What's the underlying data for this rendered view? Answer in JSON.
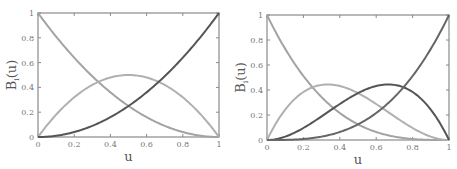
{
  "chart_data": [
    {
      "type": "line",
      "title": "",
      "xlabel": "u",
      "ylabel": "B_i(u)",
      "ylabel_main": "B",
      "ylabel_sub": "i",
      "ylabel_tail": "(u)",
      "xlim": [
        0,
        1
      ],
      "ylim": [
        0,
        1
      ],
      "xticks": [
        "0",
        "0.2",
        "0.4",
        "0.6",
        "0.8",
        "1"
      ],
      "yticks": [
        "0",
        "0.2",
        "0.4",
        "0.6",
        "0.8",
        "1"
      ],
      "grid": false,
      "degree": 2,
      "x": [
        0,
        0.1,
        0.2,
        0.3,
        0.4,
        0.5,
        0.6,
        0.7,
        0.8,
        0.9,
        1.0
      ],
      "series": [
        {
          "name": "B0 (1-u)^2",
          "color": "#a3a3a3",
          "values": [
            1.0,
            0.81,
            0.64,
            0.49,
            0.36,
            0.25,
            0.16,
            0.09,
            0.04,
            0.01,
            0.0
          ]
        },
        {
          "name": "B1 2u(1-u)",
          "color": "#b0b0b0",
          "values": [
            0.0,
            0.18,
            0.32,
            0.42,
            0.48,
            0.5,
            0.48,
            0.42,
            0.32,
            0.18,
            0.0
          ]
        },
        {
          "name": "B2 u^2",
          "color": "#555555",
          "values": [
            0.0,
            0.01,
            0.04,
            0.09,
            0.16,
            0.25,
            0.36,
            0.49,
            0.64,
            0.81,
            1.0
          ]
        }
      ]
    },
    {
      "type": "line",
      "title": "",
      "xlabel": "u",
      "ylabel": "B_i(u)",
      "ylabel_main": "B",
      "ylabel_sub": "i",
      "ylabel_tail": "(u)",
      "xlim": [
        0,
        1
      ],
      "ylim": [
        0,
        1
      ],
      "xticks": [
        "0",
        "0.2",
        "0.4",
        "0.6",
        "0.8",
        "1"
      ],
      "yticks": [
        "0",
        "0.2",
        "0.4",
        "0.6",
        "0.8",
        "1"
      ],
      "grid": false,
      "degree": 3,
      "x": [
        0,
        0.1,
        0.2,
        0.3,
        0.4,
        0.5,
        0.6,
        0.7,
        0.8,
        0.9,
        1.0
      ],
      "series": [
        {
          "name": "B0 (1-u)^3",
          "color": "#a3a3a3",
          "values": [
            1.0,
            0.729,
            0.512,
            0.343,
            0.216,
            0.125,
            0.064,
            0.027,
            0.008,
            0.001,
            0.0
          ]
        },
        {
          "name": "B1 3u(1-u)^2",
          "color": "#b0b0b0",
          "values": [
            0.0,
            0.243,
            0.384,
            0.441,
            0.432,
            0.375,
            0.288,
            0.189,
            0.096,
            0.027,
            0.0
          ]
        },
        {
          "name": "B2 3u^2(1-u)",
          "color": "#555555",
          "values": [
            0.0,
            0.027,
            0.096,
            0.189,
            0.288,
            0.375,
            0.432,
            0.441,
            0.384,
            0.243,
            0.0
          ]
        },
        {
          "name": "B3 u^3",
          "color": "#666666",
          "values": [
            0.0,
            0.001,
            0.008,
            0.027,
            0.064,
            0.125,
            0.216,
            0.343,
            0.512,
            0.729,
            1.0
          ]
        }
      ]
    }
  ],
  "layout": {
    "panels": [
      {
        "x0": 38,
        "x1": 219,
        "y0": 13,
        "y1": 137
      },
      {
        "x0": 267,
        "x1": 449,
        "y0": 15,
        "y1": 140
      }
    ]
  }
}
